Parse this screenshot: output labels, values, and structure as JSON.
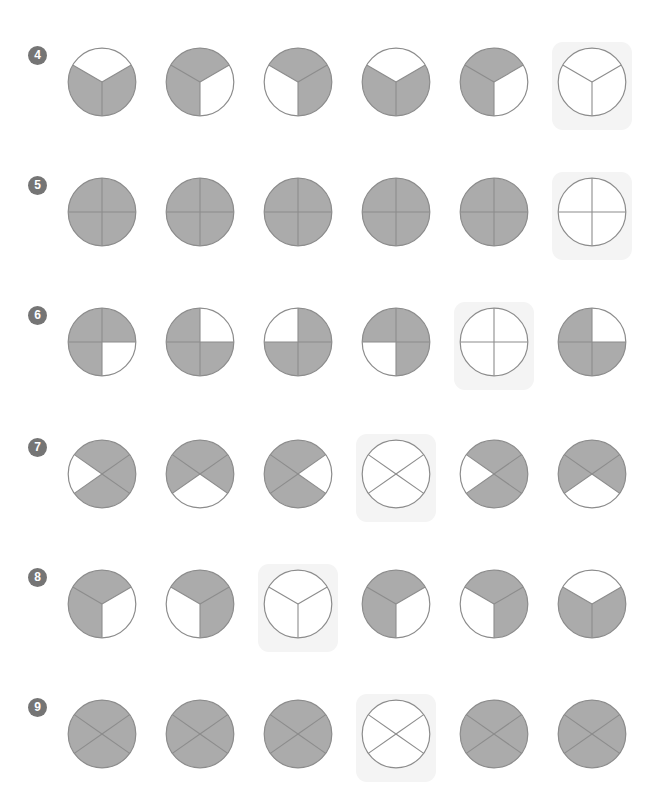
{
  "sheet": {
    "title": "Shaded circle fraction pattern worksheet rows 4 to 9",
    "colors": {
      "shade_fill": "#ababab",
      "stroke": "#8c8c8c",
      "empty_fill": "#ffffff",
      "highlight_bg": "#f4f4f4",
      "bullet_bg": "#757575",
      "bullet_text": "#ffffff",
      "page_bg": "#ffffff"
    },
    "figure_size_px": 70,
    "columns": 6,
    "column_centers_px": [
      102,
      200,
      298,
      396,
      494,
      592
    ]
  },
  "rows": [
    {
      "number": "4",
      "label": "4",
      "division": "three-wedge",
      "cells": [
        {
          "shaded": [
            "top"
          ],
          "highlighted": false
        },
        {
          "shaded": [
            "right"
          ],
          "highlighted": false
        },
        {
          "shaded": [
            "left"
          ],
          "highlighted": false
        },
        {
          "shaded": [
            "top"
          ],
          "highlighted": false
        },
        {
          "shaded": [
            "right"
          ],
          "highlighted": false
        },
        {
          "shaded": [],
          "highlighted": true
        }
      ]
    },
    {
      "number": "5",
      "label": "5",
      "division": "quadrant",
      "cells": [
        {
          "shaded": [
            "top-right",
            "bottom-left"
          ],
          "highlighted": false
        },
        {
          "shaded": [
            "top-left",
            "bottom-right"
          ],
          "highlighted": false
        },
        {
          "shaded": [
            "top-right",
            "bottom-left"
          ],
          "highlighted": false
        },
        {
          "shaded": [
            "top-left",
            "bottom-right"
          ],
          "highlighted": false
        },
        {
          "shaded": [
            "top-right",
            "bottom-left"
          ],
          "highlighted": false
        },
        {
          "shaded": [],
          "highlighted": true
        }
      ]
    },
    {
      "number": "6",
      "label": "6",
      "division": "quadrant",
      "cells": [
        {
          "shaded": [
            "bottom-right"
          ],
          "highlighted": false
        },
        {
          "shaded": [
            "top-right"
          ],
          "highlighted": false
        },
        {
          "shaded": [
            "top-left"
          ],
          "highlighted": false
        },
        {
          "shaded": [
            "bottom-left"
          ],
          "highlighted": false
        },
        {
          "shaded": [],
          "highlighted": true
        },
        {
          "shaded": [
            "top-right"
          ],
          "highlighted": false
        }
      ]
    },
    {
      "number": "7",
      "label": "7",
      "division": "x-cross",
      "cells": [
        {
          "shaded": [
            "west"
          ],
          "highlighted": false
        },
        {
          "shaded": [
            "south"
          ],
          "highlighted": false
        },
        {
          "shaded": [
            "east"
          ],
          "highlighted": false
        },
        {
          "shaded": [],
          "highlighted": true
        },
        {
          "shaded": [
            "west"
          ],
          "highlighted": false
        },
        {
          "shaded": [
            "south"
          ],
          "highlighted": false
        }
      ]
    },
    {
      "number": "8",
      "label": "8",
      "division": "three-wedge",
      "cells": [
        {
          "shaded": [
            "right"
          ],
          "highlighted": false
        },
        {
          "shaded": [
            "left"
          ],
          "highlighted": false
        },
        {
          "shaded": [],
          "highlighted": true
        },
        {
          "shaded": [
            "right"
          ],
          "highlighted": false
        },
        {
          "shaded": [
            "left"
          ],
          "highlighted": false
        },
        {
          "shaded": [
            "top"
          ],
          "highlighted": false
        }
      ]
    },
    {
      "number": "9",
      "label": "9",
      "division": "x-cross",
      "cells": [
        {
          "shaded": [
            "west",
            "east"
          ],
          "highlighted": false
        },
        {
          "shaded": [
            "north",
            "south"
          ],
          "highlighted": false
        },
        {
          "shaded": [
            "west",
            "east"
          ],
          "highlighted": false
        },
        {
          "shaded": [],
          "highlighted": true
        },
        {
          "shaded": [
            "west",
            "east"
          ],
          "highlighted": false
        },
        {
          "shaded": [
            "north",
            "south"
          ],
          "highlighted": false
        }
      ]
    }
  ]
}
